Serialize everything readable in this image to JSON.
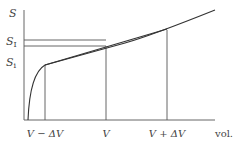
{
  "diagram": {
    "type": "concave entropy vs volume sketch",
    "y_axis_label": "S",
    "x_axis_label": "vol.",
    "y_levels": [
      {
        "name": "upper",
        "label_main": "S",
        "label_sub": "I"
      },
      {
        "name": "lower",
        "label_main": "S",
        "label_sub": "i"
      }
    ],
    "x_ticks": [
      {
        "name": "v-minus-dv",
        "label": "V − ΔV"
      },
      {
        "name": "v",
        "label": "V"
      },
      {
        "name": "v-plus-dv",
        "label": "V + ΔV"
      }
    ],
    "elements": [
      "curve S(V)",
      "chord between V−ΔV and V+ΔV",
      "horizontal lines at S_I and S_i"
    ]
  }
}
